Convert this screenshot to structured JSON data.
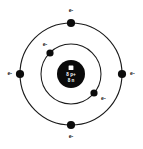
{
  "diagram": {
    "type": "bohr-atom-model",
    "background_color": "#ffffff",
    "line_color": "#1a1a1a",
    "center": {
      "x": 71,
      "y": 74
    },
    "nucleus": {
      "radius": 14,
      "fill_color": "#0a0a0a",
      "text_color": "#ffffff",
      "marker": "white-square",
      "proton_label": "8 p+",
      "neutron_label": "8 n"
    },
    "shells": [
      {
        "name": "inner-shell",
        "radius": 30,
        "electron_count": 2,
        "electrons": [
          {
            "id": "inner-electron-1",
            "label": "e-",
            "angle_deg": 135,
            "cx": 50,
            "cy": 53,
            "label_x": 45,
            "label_y": 45,
            "label_anchor": "middle"
          },
          {
            "id": "inner-electron-2",
            "label": "e-",
            "angle_deg": -38,
            "cx": 94,
            "cy": 93,
            "label_x": 101,
            "label_y": 99,
            "label_anchor": "start"
          }
        ]
      },
      {
        "name": "outer-shell",
        "radius": 51,
        "electron_count": 4,
        "electrons": [
          {
            "id": "outer-electron-top",
            "label": "e-",
            "angle_deg": 90,
            "cx": 71,
            "cy": 23,
            "label_x": 71,
            "label_y": 11,
            "label_anchor": "middle"
          },
          {
            "id": "outer-electron-right",
            "label": "e-",
            "angle_deg": 0,
            "cx": 122,
            "cy": 74,
            "label_x": 131,
            "label_y": 74,
            "label_anchor": "start"
          },
          {
            "id": "outer-electron-bottom",
            "label": "e-",
            "angle_deg": 270,
            "cx": 71,
            "cy": 125,
            "label_x": 71,
            "label_y": 137,
            "label_anchor": "middle"
          },
          {
            "id": "outer-electron-left",
            "label": "e-",
            "angle_deg": 180,
            "cx": 20,
            "cy": 74,
            "label_x": 11,
            "label_y": 74,
            "label_anchor": "end"
          }
        ]
      }
    ]
  }
}
